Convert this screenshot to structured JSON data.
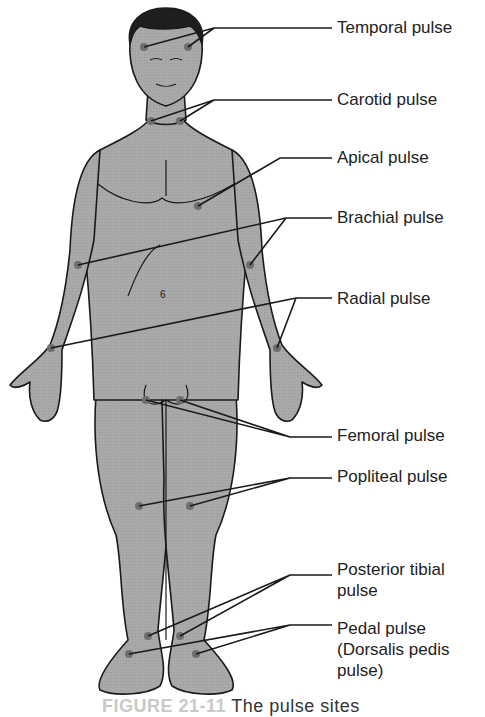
{
  "figure": {
    "title": "Pulse sites",
    "caption_number": "FIGURE 21-11",
    "caption_text": "The pulse sites",
    "colors": {
      "body_fill": "#a8a8a8",
      "outline": "#1a1a1a",
      "hair": "#1e1e1e",
      "pulse_dot": "#6e6e6e",
      "leader": "#1a1a1a"
    }
  },
  "labels": [
    {
      "id": "temporal",
      "text": "Temporal pulse",
      "top": 18
    },
    {
      "id": "carotid",
      "text": "Carotid pulse",
      "top": 90
    },
    {
      "id": "apical",
      "text": "Apical pulse",
      "top": 148
    },
    {
      "id": "brachial",
      "text": "Brachial pulse",
      "top": 208
    },
    {
      "id": "radial",
      "text": "Radial pulse",
      "top": 289
    },
    {
      "id": "femoral",
      "text": "Femoral pulse",
      "top": 426
    },
    {
      "id": "popliteal",
      "text": "Popliteal pulse",
      "top": 467
    },
    {
      "id": "posterior_tibial_1",
      "text": "Posterior tibial",
      "top": 560
    },
    {
      "id": "posterior_tibial_2",
      "text": "pulse",
      "top": 581
    },
    {
      "id": "pedal_1",
      "text": "Pedal pulse",
      "top": 619
    },
    {
      "id": "pedal_2",
      "text": "(Dorsalis pedis",
      "top": 640
    },
    {
      "id": "pedal_3",
      "text": "pulse)",
      "top": 661
    }
  ]
}
